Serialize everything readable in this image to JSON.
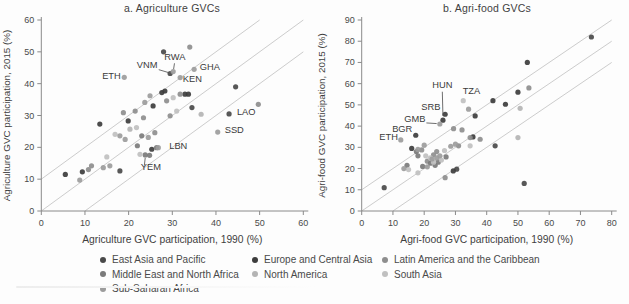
{
  "figure_name": "GVC participation scatter panels, 1990 vs 2015",
  "region_colors": {
    "EAP": "#4a4a4a",
    "ECA": "#3d3d3d",
    "LAC": "#8e8e8e",
    "MENA": "#7b7b7b",
    "NA": "#b4b4b4",
    "SA": "#c0c0c0",
    "SSA": "#9c9c9c"
  },
  "chart_data": [
    {
      "type": "scatter",
      "title": "a. Agriculture GVCs",
      "xlabel": "Agriculture GVC participation, 1990 (%)",
      "ylabel": "Agriculture GVC participation, 2015 (%)",
      "xlim": [
        0,
        60
      ],
      "ylim": [
        0,
        60
      ],
      "x_ticks": [
        0,
        10,
        20,
        30,
        40,
        50,
        60
      ],
      "y_ticks": [
        0,
        10,
        20,
        30,
        40,
        50,
        60
      ],
      "grid": false,
      "ref_lines": [
        {
          "slope": 1,
          "intercept": -10
        },
        {
          "slope": 1,
          "intercept": 0
        },
        {
          "slope": 1,
          "intercept": 10
        }
      ],
      "series": [
        {
          "name": "East Asia and Pacific",
          "key": "EAP",
          "points": [
            [
              29.5,
              43.2
            ],
            [
              43,
              30.5
            ],
            [
              28,
              50
            ],
            [
              44.5,
              39
            ],
            [
              34.5,
              32.5
            ],
            [
              18,
              12.6
            ]
          ]
        },
        {
          "name": "Europe and Central Asia",
          "key": "ECA",
          "points": [
            [
              13.4,
              27.3
            ],
            [
              19.9,
              28.3
            ],
            [
              25.6,
              33
            ],
            [
              27.6,
              37.2
            ],
            [
              28.3,
              37.7
            ],
            [
              32.9,
              36.7
            ],
            [
              5.5,
              11.5
            ],
            [
              9.4,
              12.3
            ],
            [
              25.3,
              19.4
            ],
            [
              33.7,
              36.7
            ]
          ]
        },
        {
          "name": "Latin America and the Caribbean",
          "key": "LAC",
          "points": [
            [
              10.8,
              13
            ],
            [
              11.5,
              14.2
            ],
            [
              18.8,
              30.9
            ],
            [
              21.5,
              31.4
            ],
            [
              23.4,
              29.3
            ],
            [
              28.7,
              34.6
            ],
            [
              29.5,
              29.9
            ],
            [
              31.8,
              36.7
            ],
            [
              49.7,
              33.5
            ],
            [
              34,
              51.5
            ],
            [
              26,
              24.6
            ]
          ]
        },
        {
          "name": "Middle East and North Africa",
          "key": "MENA",
          "points": [
            [
              26.4,
              19.9
            ],
            [
              23.8,
              17.6
            ],
            [
              24.8,
              17.5
            ],
            [
              23,
              23.6
            ],
            [
              22,
              20.5
            ]
          ]
        },
        {
          "name": "North America",
          "key": "NA",
          "points": [
            [
              20.3,
              25.7
            ],
            [
              36.6,
              30.4
            ]
          ]
        },
        {
          "name": "South Asia",
          "key": "SA",
          "points": [
            [
              15,
              17
            ],
            [
              16.9,
              24.1
            ],
            [
              22.6,
              17.8
            ],
            [
              30.2,
              35.6
            ],
            [
              31,
              31.4
            ],
            [
              21.8,
              26.2
            ]
          ]
        },
        {
          "name": "Sub-Saharan Africa",
          "key": "SSA",
          "points": [
            [
              19,
              42
            ],
            [
              30.2,
              43.8
            ],
            [
              31.8,
              41.9
            ],
            [
              35,
              44.5
            ],
            [
              40.4,
              24.8
            ],
            [
              24.9,
              36.2
            ],
            [
              23.7,
              34.1
            ],
            [
              18,
              23.6
            ],
            [
              19.2,
              22.5
            ],
            [
              14.2,
              13.6
            ],
            [
              15.7,
              14.2
            ],
            [
              26.8,
              19.9
            ],
            [
              24.5,
              23.1
            ],
            [
              8.8,
              9.7
            ]
          ]
        }
      ],
      "annotations": [
        {
          "label": "ETH",
          "x": 18.2,
          "y": 41.6,
          "anchor": "end",
          "line": null
        },
        {
          "label": "VNM",
          "x": 26.6,
          "y": 44.8,
          "anchor": "end",
          "line": [
            26.9,
            44.4,
            29.1,
            43.5
          ]
        },
        {
          "label": "RWA",
          "x": 30.6,
          "y": 47.4,
          "anchor": "middle",
          "line": [
            30.5,
            46.4,
            30.3,
            44.6
          ]
        },
        {
          "label": "GHA",
          "x": 36.3,
          "y": 44.4,
          "anchor": "start",
          "line": null
        },
        {
          "label": "KEN",
          "x": 32.4,
          "y": 40.4,
          "anchor": "start",
          "line": null
        },
        {
          "label": "LAO",
          "x": 44.8,
          "y": 30.2,
          "anchor": "start",
          "line": null
        },
        {
          "label": "SSD",
          "x": 42.0,
          "y": 24.5,
          "anchor": "start",
          "line": null
        },
        {
          "label": "LBN",
          "x": 29.3,
          "y": 19.6,
          "anchor": "start",
          "line": null
        },
        {
          "label": "YEM",
          "x": 22.8,
          "y": 13.0,
          "anchor": "start",
          "line": [
            23.6,
            14.3,
            23.8,
            16.7
          ]
        }
      ]
    },
    {
      "type": "scatter",
      "title": "b. Agri-food GVCs",
      "xlabel": "Agri-food GVC participation, 1990 (%)",
      "ylabel": "Agri-food GVC participation, 2015 (%)",
      "xlim": [
        0,
        80
      ],
      "ylim": [
        0,
        90
      ],
      "x_ticks": [
        0,
        10,
        20,
        30,
        40,
        50,
        60,
        70,
        80
      ],
      "y_ticks": [
        0,
        10,
        20,
        30,
        40,
        50,
        60,
        70,
        80,
        90
      ],
      "grid": false,
      "ref_lines": [
        {
          "slope": 1,
          "intercept": -10
        },
        {
          "slope": 1,
          "intercept": 0
        },
        {
          "slope": 1,
          "intercept": 10
        }
      ],
      "series": [
        {
          "name": "East Asia and Pacific",
          "key": "EAP",
          "points": [
            [
              73.5,
              82
            ],
            [
              52,
              13
            ],
            [
              42.7,
              30.7
            ],
            [
              30.4,
              19.7
            ],
            [
              7.2,
              11
            ]
          ]
        },
        {
          "name": "Europe and Central Asia",
          "key": "ECA",
          "points": [
            [
              26,
              42.8
            ],
            [
              26.7,
              45.6
            ],
            [
              17.3,
              35.7
            ],
            [
              53,
              70
            ],
            [
              50,
              56
            ],
            [
              42,
              52
            ],
            [
              36.3,
              44.8
            ],
            [
              46,
              50.3
            ],
            [
              16,
              29.5
            ],
            [
              35.6,
              34.9
            ],
            [
              29.3,
              18.9
            ]
          ]
        },
        {
          "name": "Latin America and the Caribbean",
          "key": "LAC",
          "points": [
            [
              53.5,
              58
            ],
            [
              37.9,
              33.8
            ],
            [
              34.7,
              34.6
            ],
            [
              31,
              30.7
            ],
            [
              29.4,
              38.8
            ],
            [
              32.1,
              38.2
            ],
            [
              24,
              28
            ],
            [
              23,
              26.5
            ],
            [
              21,
              23.5
            ],
            [
              26.7,
              15.7
            ],
            [
              19.2,
              28.8
            ]
          ]
        },
        {
          "name": "Middle East and North Africa",
          "key": "MENA",
          "points": [
            [
              17.5,
              28
            ],
            [
              18,
              26
            ],
            [
              19.5,
              21
            ],
            [
              22,
              22.5
            ],
            [
              23.5,
              21.5
            ],
            [
              24.5,
              23
            ],
            [
              14.5,
              21.5
            ],
            [
              27,
              25.5
            ]
          ]
        },
        {
          "name": "North America",
          "key": "NA",
          "points": [
            [
              50,
              34.6
            ],
            [
              50.7,
              48.4
            ]
          ]
        },
        {
          "name": "South Asia",
          "key": "SA",
          "points": [
            [
              15,
              19.5
            ],
            [
              18,
              18
            ],
            [
              20.5,
              26
            ],
            [
              22,
              25
            ],
            [
              23,
              23
            ],
            [
              25.5,
              24
            ],
            [
              26.5,
              28.5
            ],
            [
              32.5,
              52
            ],
            [
              34.7,
              30.7
            ]
          ]
        },
        {
          "name": "Sub-Saharan Africa",
          "key": "SSA",
          "points": [
            [
              34.2,
              48
            ],
            [
              25,
              41
            ],
            [
              12.5,
              33.5
            ],
            [
              13.5,
              20
            ],
            [
              20,
              31
            ],
            [
              25,
              26
            ],
            [
              30,
              31.5
            ],
            [
              21,
              20.8
            ],
            [
              22.5,
              24.5
            ],
            [
              24,
              25
            ],
            [
              28.5,
              30.5
            ],
            [
              18,
              29
            ]
          ]
        }
      ],
      "annotations": [
        {
          "label": "HUN",
          "x": 25.8,
          "y": 58.0,
          "anchor": "middle",
          "line": [
            25.8,
            56.2,
            26,
            44.8
          ]
        },
        {
          "label": "TZA",
          "x": 32.3,
          "y": 55.0,
          "anchor": "start",
          "line": null
        },
        {
          "label": "SRB",
          "x": 25.2,
          "y": 47.8,
          "anchor": "end",
          "line": null
        },
        {
          "label": "GMB",
          "x": 20.4,
          "y": 41.9,
          "anchor": "end",
          "line": [
            20.7,
            41.5,
            24,
            41.2
          ]
        },
        {
          "label": "BGR",
          "x": 16.2,
          "y": 37.2,
          "anchor": "end",
          "line": null
        },
        {
          "label": "ETH",
          "x": 11.6,
          "y": 33.4,
          "anchor": "end",
          "line": null
        }
      ]
    }
  ],
  "legend": {
    "items": [
      {
        "label": "East Asia and Pacific",
        "region": "EAP",
        "col": 0,
        "row": 0
      },
      {
        "label": "Europe and Central Asia",
        "region": "ECA",
        "col": 1,
        "row": 0
      },
      {
        "label": "Latin America and the Caribbean",
        "region": "LAC",
        "col": 2,
        "row": 0
      },
      {
        "label": "Middle East and North Africa",
        "region": "MENA",
        "col": 0,
        "row": 1
      },
      {
        "label": "North America",
        "region": "NA",
        "col": 1,
        "row": 1
      },
      {
        "label": "South Asia",
        "region": "SA",
        "col": 2,
        "row": 1
      },
      {
        "label": "Sub-Saharan Africa",
        "region": "SSA",
        "col": 0,
        "row": 2
      }
    ]
  }
}
